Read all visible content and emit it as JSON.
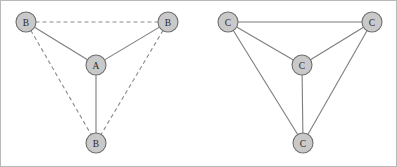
{
  "figure": {
    "background_color": "#ffffff",
    "frame_color": "#b9b9b9",
    "width": 397,
    "height": 167,
    "node_fill": "#c9c9c9",
    "node_stroke": "#6e6e6e",
    "edge_solid_color": "#7d7d7d",
    "edge_dashed_color": "#8a8a8a",
    "label_color": "#2b2b2b",
    "node_radius": 10
  },
  "graphs": [
    {
      "id": "left-graph",
      "name": "left-graph",
      "description": "complete-graph-K4-mixed-edges",
      "nodes": [
        {
          "id": "L1",
          "label": "B",
          "x": 26,
          "y": 22,
          "position": "top-left"
        },
        {
          "id": "L2",
          "label": "B",
          "x": 168,
          "y": 22,
          "position": "top-right"
        },
        {
          "id": "L3",
          "label": "A",
          "x": 96,
          "y": 65,
          "position": "center"
        },
        {
          "id": "L4",
          "label": "B",
          "x": 96,
          "y": 143,
          "position": "bottom"
        }
      ],
      "edges": [
        {
          "from": "L1",
          "to": "L2",
          "style": "dashed"
        },
        {
          "from": "L1",
          "to": "L4",
          "style": "dashed"
        },
        {
          "from": "L2",
          "to": "L4",
          "style": "dashed"
        },
        {
          "from": "L1",
          "to": "L3",
          "style": "solid"
        },
        {
          "from": "L2",
          "to": "L3",
          "style": "solid"
        },
        {
          "from": "L3",
          "to": "L4",
          "style": "solid"
        }
      ]
    },
    {
      "id": "right-graph",
      "name": "right-graph",
      "description": "complete-graph-K4-all-solid-edges",
      "nodes": [
        {
          "id": "R1",
          "label": "C",
          "x": 228,
          "y": 22,
          "position": "top-left"
        },
        {
          "id": "R2",
          "label": "C",
          "x": 372,
          "y": 22,
          "position": "top-right"
        },
        {
          "id": "R3",
          "label": "C",
          "x": 302,
          "y": 65,
          "position": "center"
        },
        {
          "id": "R4",
          "label": "C",
          "x": 303,
          "y": 143,
          "position": "bottom"
        }
      ],
      "edges": [
        {
          "from": "R1",
          "to": "R2",
          "style": "solid"
        },
        {
          "from": "R1",
          "to": "R4",
          "style": "solid"
        },
        {
          "from": "R2",
          "to": "R4",
          "style": "solid"
        },
        {
          "from": "R1",
          "to": "R3",
          "style": "solid"
        },
        {
          "from": "R2",
          "to": "R3",
          "style": "solid"
        },
        {
          "from": "R3",
          "to": "R4",
          "style": "solid"
        }
      ]
    }
  ]
}
